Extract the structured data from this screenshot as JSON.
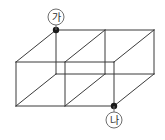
{
  "figure": {
    "background_color": "#ffffff",
    "line_color": "#3b3b3b",
    "vertex_dot_color": "#1a1a1a",
    "label_circle_color": "#6e6e6e",
    "projection": "oblique",
    "cube_count": 2
  },
  "labels": {
    "top": {
      "text": "가",
      "name": "label-ga",
      "circle_cx": 56,
      "circle_cy": 17,
      "circle_r": 8,
      "leader_x1": 56,
      "leader_y1": 25,
      "leader_x2": 56,
      "leader_y2": 30
    },
    "bottom": {
      "text": "나",
      "name": "label-na",
      "circle_cx": 114,
      "circle_cy": 120,
      "circle_r": 8,
      "leader_x1": 114,
      "leader_y1": 112,
      "leader_x2": 114,
      "leader_y2": 106
    }
  },
  "points": [
    {
      "name": "point-ga",
      "label": "가",
      "x": 56,
      "y": 30,
      "r": 3.2,
      "vertex": "back-top-left"
    },
    {
      "name": "point-na",
      "label": "나",
      "x": 114,
      "y": 106,
      "r": 3.2,
      "vertex": "front-bottom-middle"
    }
  ],
  "geometry": {
    "front_bottom_left": [
      16,
      106
    ],
    "front_top_left": [
      16,
      62
    ],
    "cube_edge_px": 49,
    "depth_dx": 40,
    "depth_dy": -32,
    "front_face_x": [
      16,
      65,
      114
    ],
    "front_face_y": [
      62,
      106
    ],
    "back_face_x": [
      56,
      105,
      154
    ],
    "back_face_y": [
      30,
      74
    ]
  },
  "edges": {
    "front_verticals": [
      {
        "name": "front-vertical-left",
        "x1": 16,
        "y1": 62,
        "x2": 16,
        "y2": 106
      },
      {
        "name": "front-vertical-middle",
        "x1": 65,
        "y1": 62,
        "x2": 65,
        "y2": 106
      },
      {
        "name": "front-vertical-right",
        "x1": 114,
        "y1": 62,
        "x2": 114,
        "y2": 106
      }
    ],
    "back_verticals": [
      {
        "name": "back-vertical-left",
        "x1": 56,
        "y1": 30,
        "x2": 56,
        "y2": 74
      },
      {
        "name": "back-vertical-middle",
        "x1": 105,
        "y1": 30,
        "x2": 105,
        "y2": 74
      },
      {
        "name": "back-vertical-right",
        "x1": 154,
        "y1": 30,
        "x2": 154,
        "y2": 74
      }
    ],
    "front_horizontals": [
      {
        "name": "front-top-edge",
        "x1": 16,
        "y1": 62,
        "x2": 114,
        "y2": 62
      },
      {
        "name": "front-bottom-edge",
        "x1": 16,
        "y1": 106,
        "x2": 114,
        "y2": 106
      }
    ],
    "back_horizontals": [
      {
        "name": "back-top-edge",
        "x1": 56,
        "y1": 30,
        "x2": 154,
        "y2": 30
      },
      {
        "name": "back-bottom-edge",
        "x1": 56,
        "y1": 74,
        "x2": 154,
        "y2": 74
      }
    ],
    "depth_edges": [
      {
        "name": "depth-top-left",
        "x1": 16,
        "y1": 62,
        "x2": 56,
        "y2": 30
      },
      {
        "name": "depth-top-middle",
        "x1": 65,
        "y1": 62,
        "x2": 105,
        "y2": 30
      },
      {
        "name": "depth-top-right",
        "x1": 114,
        "y1": 62,
        "x2": 154,
        "y2": 30
      },
      {
        "name": "depth-bottom-left",
        "x1": 16,
        "y1": 106,
        "x2": 56,
        "y2": 74
      },
      {
        "name": "depth-bottom-middle",
        "x1": 65,
        "y1": 106,
        "x2": 105,
        "y2": 74
      },
      {
        "name": "depth-bottom-right",
        "x1": 114,
        "y1": 106,
        "x2": 154,
        "y2": 74
      }
    ]
  }
}
